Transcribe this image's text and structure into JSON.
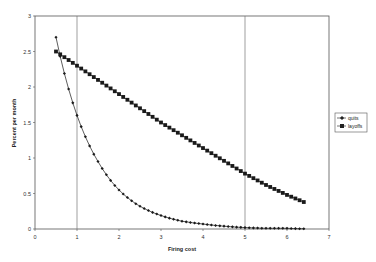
{
  "chart_data": {
    "type": "line",
    "title": "",
    "xlabel": "Firing cost",
    "ylabel": "Percent per month",
    "xlim": [
      0,
      7
    ],
    "ylim": [
      0,
      3
    ],
    "x_ticks": [
      "0",
      "1",
      "2",
      "3",
      "4",
      "5",
      "6",
      "7"
    ],
    "y_ticks": [
      "0",
      "0.5",
      "1",
      "1.5",
      "2",
      "2.5",
      "3"
    ],
    "grid": false,
    "legend_position": "right",
    "reference_lines_x": [
      1,
      5
    ],
    "x": [
      0.5,
      1.0,
      1.5,
      2.0,
      2.5,
      3.0,
      3.5,
      4.0,
      4.5,
      5.0,
      5.5,
      6.0,
      6.4
    ],
    "series": [
      {
        "name": "quits",
        "marker": "diamond",
        "values": [
          2.7,
          1.6,
          0.95,
          0.55,
          0.32,
          0.19,
          0.11,
          0.07,
          0.04,
          0.02,
          0.01,
          0.01,
          0.0
        ]
      },
      {
        "name": "layoffs",
        "marker": "square",
        "values": [
          2.5,
          2.3,
          2.1,
          1.9,
          1.7,
          1.5,
          1.32,
          1.14,
          0.96,
          0.78,
          0.62,
          0.48,
          0.38
        ]
      }
    ],
    "sampling_step": 0.1
  },
  "legend": {
    "items": [
      {
        "label": "quits"
      },
      {
        "label": "layoffs"
      }
    ]
  }
}
